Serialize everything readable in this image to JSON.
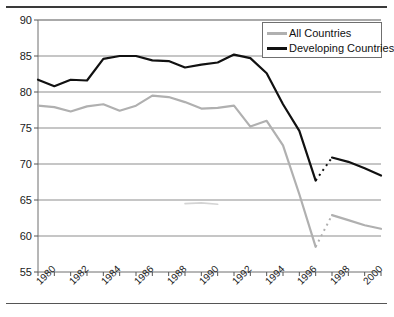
{
  "chart_data": {
    "type": "line",
    "title": "",
    "xlabel": "",
    "ylabel": "",
    "xlim": [
      1980,
      2001
    ],
    "ylim": [
      55,
      90
    ],
    "grid": true,
    "legend_position": "top-right",
    "y_ticks": [
      55,
      60,
      65,
      70,
      75,
      80,
      85,
      90
    ],
    "x_ticks": [
      1980,
      1981,
      1982,
      1983,
      1984,
      1985,
      1986,
      1987,
      1988,
      1989,
      1990,
      1991,
      1992,
      1993,
      1994,
      1995,
      1996,
      1997,
      1998,
      1999,
      2000,
      2001
    ],
    "x_tick_labels": [
      "1980",
      "",
      "1982",
      "",
      "1984",
      "",
      "1986",
      "",
      "1988",
      "",
      "1990",
      "",
      "1992",
      "",
      "1994",
      "",
      "1996",
      "",
      "1998",
      "",
      "2000",
      ""
    ],
    "x": [
      1980,
      1981,
      1982,
      1983,
      1984,
      1985,
      1986,
      1987,
      1988,
      1989,
      1990,
      1991,
      1992,
      1993,
      1994,
      1995,
      1996,
      1997,
      1998,
      1999,
      2000,
      2001
    ],
    "series": [
      {
        "name": "All Countries",
        "color": "#b0b0b0",
        "segments": [
          {
            "x": [
              1980,
              1981,
              1982,
              1983,
              1984,
              1985,
              1986,
              1987,
              1988,
              1989,
              1990,
              1991,
              1992,
              1993,
              1994,
              1995,
              1996,
              1997
            ],
            "values": [
              78.1,
              77.9,
              77.3,
              78.0,
              78.3,
              77.4,
              78.1,
              79.5,
              79.3,
              78.6,
              77.7,
              77.8,
              78.1,
              75.2,
              76.0,
              72.6,
              65.8,
              58.5
            ]
          },
          {
            "x": [
              1998,
              1999,
              2000,
              2001
            ],
            "values": [
              62.9,
              62.2,
              61.5,
              61.0
            ]
          }
        ],
        "detached_segment": {
          "x": [
            1989,
            1990,
            1991
          ],
          "values": [
            64.5,
            64.6,
            64.4
          ],
          "note": "faint partial gray segment near 64.5"
        }
      },
      {
        "name": "Developing Countries",
        "color": "#111111",
        "segments": [
          {
            "x": [
              1980,
              1981,
              1982,
              1983,
              1984,
              1985,
              1986,
              1987,
              1988,
              1989,
              1990,
              1991,
              1992,
              1993,
              1994,
              1995,
              1996,
              1997
            ],
            "values": [
              81.7,
              80.8,
              81.7,
              81.6,
              84.6,
              85.0,
              85.0,
              84.4,
              84.3,
              83.4,
              83.8,
              84.1,
              85.2,
              84.7,
              82.6,
              78.3,
              74.6,
              67.7
            ]
          },
          {
            "x": [
              1998,
              1999,
              2000,
              2001
            ],
            "values": [
              70.9,
              70.3,
              69.4,
              68.4
            ]
          }
        ]
      }
    ]
  },
  "legend": {
    "items": [
      {
        "label": "All Countries",
        "color": "#b0b0b0",
        "width": 3
      },
      {
        "label": "Developing Countries",
        "color": "#111111",
        "width": 3
      }
    ]
  }
}
